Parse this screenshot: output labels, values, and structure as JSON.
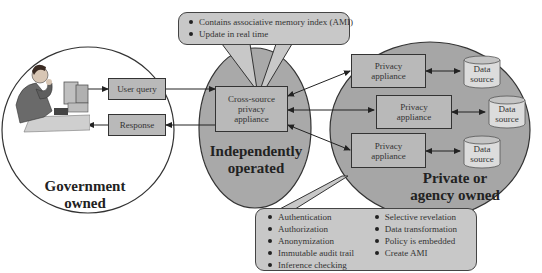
{
  "diagram": {
    "regions": {
      "government": {
        "label": "Government owned",
        "line1": "Government",
        "line2": "owned"
      },
      "independent": {
        "label": "Independently operated",
        "line1": "Independently",
        "line2": "operated"
      },
      "private": {
        "label": "Private or agency owned",
        "line1": "Private or",
        "line2": "agency owned"
      }
    },
    "boxes": {
      "user_query": "User query",
      "response": "Response",
      "cross_source": {
        "line1": "Cross-source",
        "line2": "privacy",
        "line3": "appliance"
      },
      "privacy_appliances": [
        {
          "line1": "Privacy",
          "line2": "appliance"
        },
        {
          "line1": "Privacy",
          "line2": "appliance"
        },
        {
          "line1": "Privacy",
          "line2": "appliance"
        }
      ],
      "data_sources": [
        {
          "line1": "Data",
          "line2": "source"
        },
        {
          "line1": "Data",
          "line2": "source"
        },
        {
          "line1": "Data",
          "line2": "source"
        }
      ]
    },
    "callouts": {
      "top": [
        "Contains associative memory index (AMI)",
        "Update in real time"
      ],
      "bottom_left": [
        "Authentication",
        "Authorization",
        "Anonymization",
        "Immutable audit trail",
        "Inference checking"
      ],
      "bottom_right": [
        "Selective revelation",
        "Data transformation",
        "Policy is embedded",
        "Create AMI"
      ]
    },
    "colors": {
      "background": "#ffffff",
      "ellipse_fill": "#a9a9a9",
      "box_fill": "#b9b9b9",
      "callout_fill": "#c8c8c8",
      "cylinder_fill": "#dcdcdc",
      "stroke": "#333333"
    }
  }
}
